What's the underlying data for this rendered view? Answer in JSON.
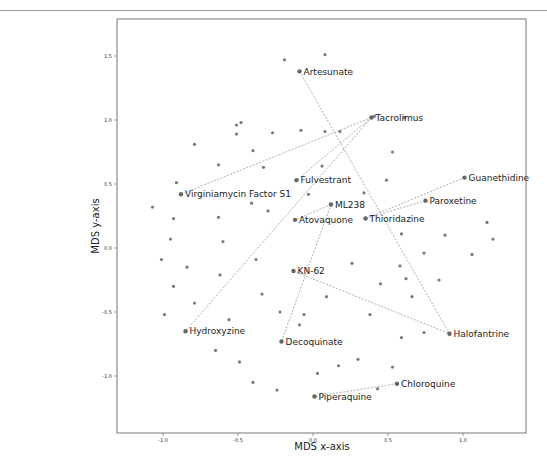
{
  "chart_data": {
    "type": "scatter",
    "title": "",
    "xlabel": "MDS x-axis",
    "ylabel": "MDS y-axis",
    "xlim": [
      -1.3,
      1.42
    ],
    "ylim": [
      -1.45,
      1.8
    ],
    "xticks": [
      -1.0,
      -0.5,
      0.0,
      0.5,
      1.0
    ],
    "xtick_labels": [
      "-1.0",
      "-0.5",
      "0.0",
      "0.5",
      "1.0"
    ],
    "yticks": [
      -1.0,
      -0.5,
      0.0,
      0.5,
      1.0,
      1.5
    ],
    "ytick_labels": [
      "-1.0",
      "-0.5",
      "0.0",
      "0.5",
      "1.0",
      "1.5"
    ],
    "grid": false,
    "legend": null,
    "labeled_points": [
      {
        "name": "Artesunate",
        "x": -0.09,
        "y": 1.38
      },
      {
        "name": "Tacrolimus",
        "x": 0.39,
        "y": 1.02
      },
      {
        "name": "Virginiamycin Factor S1",
        "x": -0.88,
        "y": 0.42
      },
      {
        "name": "Fulvestrant",
        "x": -0.11,
        "y": 0.53
      },
      {
        "name": "Guanethidine",
        "x": 1.01,
        "y": 0.55
      },
      {
        "name": "Paroxetine",
        "x": 0.75,
        "y": 0.37
      },
      {
        "name": "ML238",
        "x": 0.12,
        "y": 0.34
      },
      {
        "name": "Atovaquone",
        "x": -0.12,
        "y": 0.22
      },
      {
        "name": "Thioridazine",
        "x": 0.35,
        "y": 0.23
      },
      {
        "name": "KN-62",
        "x": -0.13,
        "y": -0.18
      },
      {
        "name": "Hydroxyzine",
        "x": -0.85,
        "y": -0.65
      },
      {
        "name": "Decoquinate",
        "x": -0.21,
        "y": -0.73
      },
      {
        "name": "Halofantrine",
        "x": 0.91,
        "y": -0.67
      },
      {
        "name": "Chloroquine",
        "x": 0.56,
        "y": -1.06
      },
      {
        "name": "Piperaquine",
        "x": 0.01,
        "y": -1.16
      }
    ],
    "connections": [
      [
        "Artesunate",
        "Halofantrine"
      ],
      [
        "Tacrolimus",
        "Virginiamycin Factor S1"
      ],
      [
        "Tacrolimus",
        "Fulvestrant"
      ],
      [
        "Tacrolimus",
        "Hydroxyzine"
      ],
      [
        "Guanethidine",
        "Thioridazine"
      ],
      [
        "Paroxetine",
        "Thioridazine"
      ],
      [
        "ML238",
        "Atovaquone"
      ],
      [
        "ML238",
        "Decoquinate"
      ],
      [
        "KN-62",
        "Halofantrine"
      ],
      [
        "Chloroquine",
        "Piperaquine"
      ]
    ],
    "unlabeled_points": [
      [
        -0.19,
        1.47
      ],
      [
        0.08,
        1.51
      ],
      [
        -0.79,
        0.81
      ],
      [
        -0.51,
        0.89
      ],
      [
        -0.51,
        0.96
      ],
      [
        -0.48,
        0.98
      ],
      [
        -0.08,
        0.92
      ],
      [
        0.08,
        0.91
      ],
      [
        0.18,
        0.91
      ],
      [
        0.41,
        1.03
      ],
      [
        0.61,
        1.02
      ],
      [
        -0.63,
        0.65
      ],
      [
        -0.4,
        0.76
      ],
      [
        -0.27,
        0.9
      ],
      [
        -0.33,
        0.63
      ],
      [
        0.53,
        0.75
      ],
      [
        0.49,
        0.53
      ],
      [
        0.34,
        0.43
      ],
      [
        0.06,
        0.64
      ],
      [
        -0.03,
        0.42
      ],
      [
        -0.91,
        0.51
      ],
      [
        -1.07,
        0.32
      ],
      [
        -0.93,
        0.23
      ],
      [
        -0.63,
        0.24
      ],
      [
        -0.41,
        0.35
      ],
      [
        -0.3,
        0.29
      ],
      [
        -0.95,
        0.07
      ],
      [
        -0.6,
        0.05
      ],
      [
        -0.38,
        -0.09
      ],
      [
        -1.01,
        -0.09
      ],
      [
        -0.84,
        -0.15
      ],
      [
        -0.62,
        -0.21
      ],
      [
        -0.93,
        -0.3
      ],
      [
        -0.79,
        -0.43
      ],
      [
        -0.34,
        -0.36
      ],
      [
        -0.99,
        -0.52
      ],
      [
        -0.56,
        -0.56
      ],
      [
        -0.22,
        -0.5
      ],
      [
        -0.65,
        -0.8
      ],
      [
        -0.49,
        -0.89
      ],
      [
        -0.4,
        -1.05
      ],
      [
        -0.24,
        -1.11
      ],
      [
        -0.06,
        -0.52
      ],
      [
        -0.09,
        -0.6
      ],
      [
        0.03,
        -0.98
      ],
      [
        0.17,
        -0.92
      ],
      [
        0.3,
        -0.87
      ],
      [
        0.43,
        -1.1
      ],
      [
        0.26,
        -0.12
      ],
      [
        0.09,
        -0.38
      ],
      [
        0.45,
        -0.28
      ],
      [
        0.38,
        -0.52
      ],
      [
        0.59,
        0.11
      ],
      [
        0.58,
        -0.14
      ],
      [
        0.62,
        -0.24
      ],
      [
        0.66,
        -0.38
      ],
      [
        0.74,
        -0.04
      ],
      [
        0.84,
        -0.25
      ],
      [
        0.88,
        0.1
      ],
      [
        1.06,
        -0.05
      ],
      [
        1.16,
        0.2
      ],
      [
        1.2,
        0.07
      ],
      [
        0.74,
        -0.66
      ],
      [
        0.59,
        -0.7
      ],
      [
        0.53,
        -0.93
      ]
    ]
  },
  "style": {
    "point_color": "#7a7a7a",
    "label_point_color": "#666666",
    "line_color": "#777777",
    "frame_color": "#555555",
    "background": "#ffffff"
  },
  "layout": {
    "axes_px": {
      "left": 117,
      "top": 19,
      "right": 526,
      "bottom": 433
    },
    "x_px_per_unit": 150,
    "x_zero_px": 313,
    "y_px_per_unit": 128,
    "y_zero_px": 248
  }
}
